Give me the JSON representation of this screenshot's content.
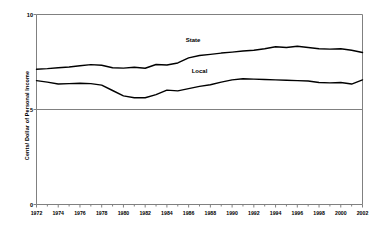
{
  "chart_data": {
    "type": "line",
    "title": "",
    "subtitle": "",
    "xlabel": "",
    "ylabel": "Cents/ Dollar of Personal Income",
    "xlim": [
      1972,
      2002
    ],
    "ylim": [
      0,
      10
    ],
    "yticks": [
      0,
      5,
      10
    ],
    "ytick_labels": [
      "0",
      "5",
      "10"
    ],
    "xticks": [
      1972,
      1974,
      1976,
      1978,
      1980,
      1982,
      1984,
      1986,
      1988,
      1990,
      1992,
      1994,
      1996,
      1998,
      2000,
      2002
    ],
    "xtick_labels": [
      "1972",
      "1974",
      "1976",
      "1978",
      "1980",
      "1982",
      "1984",
      "1986",
      "1988",
      "1990",
      "1992",
      "1994",
      "1996",
      "1998",
      "2000",
      "2002"
    ],
    "x_minor_tick_interval": 1,
    "grid": "horizontal-only",
    "gridlines_at": [
      5,
      10
    ],
    "legend_position": "inline-annotations",
    "line_color": "#000000",
    "line_width": 1.4,
    "axis_color": "#808080",
    "background_color": "#ffffff",
    "x": [
      1972,
      1973,
      1974,
      1975,
      1976,
      1977,
      1978,
      1979,
      1980,
      1981,
      1982,
      1983,
      1984,
      1985,
      1986,
      1987,
      1988,
      1989,
      1990,
      1991,
      1992,
      1993,
      1994,
      1995,
      1996,
      1997,
      1998,
      1999,
      2000,
      2001,
      2002
    ],
    "series": [
      {
        "name": "State",
        "label": "State",
        "label_x": 1986.4,
        "label_y": 8.62,
        "values": [
          7.12,
          7.15,
          7.2,
          7.24,
          7.3,
          7.36,
          7.33,
          7.2,
          7.18,
          7.22,
          7.17,
          7.37,
          7.34,
          7.45,
          7.72,
          7.84,
          7.9,
          7.97,
          8.02,
          8.08,
          8.12,
          8.2,
          8.3,
          8.26,
          8.33,
          8.26,
          8.2,
          8.18,
          8.2,
          8.12,
          8.0
        ]
      },
      {
        "name": "Local",
        "label": "Local",
        "label_x": 1987.0,
        "label_y": 7.0,
        "values": [
          6.52,
          6.44,
          6.34,
          6.36,
          6.38,
          6.36,
          6.28,
          6.0,
          5.72,
          5.62,
          5.62,
          5.78,
          6.02,
          5.98,
          6.1,
          6.22,
          6.3,
          6.44,
          6.56,
          6.62,
          6.6,
          6.58,
          6.56,
          6.54,
          6.52,
          6.5,
          6.42,
          6.4,
          6.42,
          6.34,
          6.56
        ]
      }
    ]
  },
  "axes": {
    "y_title": "Cents/ Dollar of Personal Income",
    "y_labels": [
      "10",
      "5",
      "0"
    ],
    "x_labels": [
      "1972",
      "1974",
      "1976",
      "1978",
      "1980",
      "1982",
      "1984",
      "1986",
      "1988",
      "1990",
      "1992",
      "1994",
      "1996",
      "1998",
      "2000",
      "2002"
    ]
  },
  "annotations": {
    "state": "State",
    "local": "Local"
  }
}
